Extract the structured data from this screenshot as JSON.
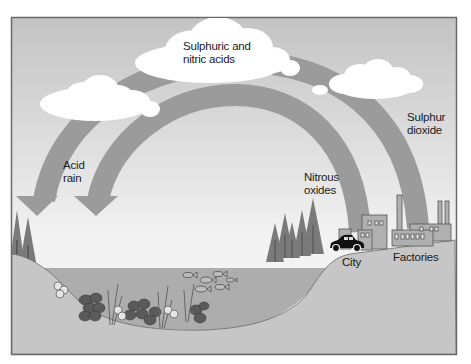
{
  "diagram": {
    "colors": {
      "frame_border": "#6a6a6a",
      "sky_top": "#c3c3c3",
      "sky_bottom": "#f5f5f5",
      "arc": "#9b9b9b",
      "ground": "#c6c6c6",
      "water": "#adadad",
      "cloud": "#ffffff",
      "tree": "#7a7a7a",
      "building": "#b0b0b0",
      "car": "#111111"
    },
    "labels": {
      "clouds_acids": {
        "line1": "Sulphuric and",
        "line2": "nitric acids"
      },
      "acid_rain": {
        "line1": "Acid",
        "line2": "rain"
      },
      "nitrous_oxides": {
        "line1": "Nitrous",
        "line2": "oxides"
      },
      "sulphur_dioxide": {
        "line1": "Sulphur",
        "line2": "dioxide"
      },
      "city": "City",
      "factories": "Factories"
    },
    "elements": {
      "arrows": [
        {
          "name": "sulphur-dioxide-arc",
          "from": "Factories",
          "to": "Clouds / Acid rain"
        },
        {
          "name": "nitrous-oxides-arc",
          "from": "City",
          "to": "Clouds / Acid rain"
        }
      ],
      "clouds": 3,
      "lake": {
        "fish_count": 7,
        "plants": true
      },
      "trees_left": 2,
      "trees_right": 5
    }
  }
}
